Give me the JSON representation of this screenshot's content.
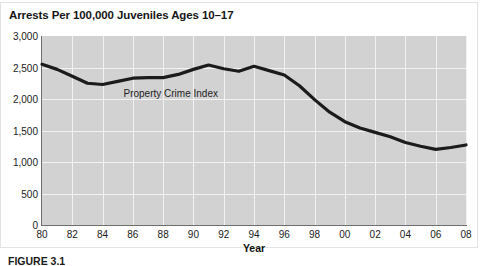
{
  "figure": {
    "title": "Arrests Per 100,000 Juveniles Ages 10–17",
    "caption": "FIGURE 3.1"
  },
  "chart_data": {
    "type": "line",
    "title": "Arrests Per 100,000 Juveniles Ages 10–17",
    "xlabel": "Year",
    "ylabel": "",
    "xlim": [
      1980,
      2008
    ],
    "ylim": [
      0,
      3000
    ],
    "grid": true,
    "legend_position": "inline-annotation",
    "annotations": [
      {
        "text": "Property Crime Index",
        "x": 1988.5,
        "y": 2100
      }
    ],
    "ytick_labels": [
      "3,000",
      "2,500",
      "2,000",
      "1,500",
      "1,000",
      "500",
      "0"
    ],
    "ytick_values": [
      3000,
      2500,
      2000,
      1500,
      1000,
      500,
      0
    ],
    "xtick_labels": [
      "80",
      "82",
      "84",
      "86",
      "88",
      "90",
      "92",
      "94",
      "96",
      "98",
      "00",
      "02",
      "04",
      "06",
      "08"
    ],
    "xtick_values": [
      1980,
      1982,
      1984,
      1986,
      1988,
      1990,
      1992,
      1994,
      1996,
      1998,
      2000,
      2002,
      2004,
      2006,
      2008
    ],
    "series": [
      {
        "name": "Property Crime Index",
        "color": "#1b1b1b",
        "x": [
          1980,
          1981,
          1982,
          1983,
          1984,
          1985,
          1986,
          1987,
          1988,
          1989,
          1990,
          1991,
          1992,
          1993,
          1994,
          1995,
          1996,
          1997,
          1998,
          1999,
          2000,
          2001,
          2002,
          2003,
          2004,
          2005,
          2006,
          2007,
          2008
        ],
        "values": [
          2550,
          2470,
          2360,
          2250,
          2230,
          2280,
          2330,
          2340,
          2340,
          2390,
          2470,
          2540,
          2480,
          2440,
          2520,
          2450,
          2380,
          2210,
          1990,
          1790,
          1640,
          1540,
          1470,
          1400,
          1310,
          1250,
          1200,
          1230,
          1270
        ]
      }
    ]
  }
}
